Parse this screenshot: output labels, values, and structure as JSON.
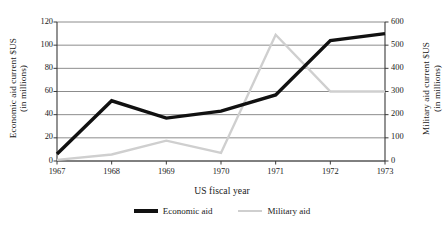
{
  "chart_data": {
    "type": "line",
    "title": "",
    "xlabel": "US fiscal year",
    "ylabel": "Economic aid current $US\n(in millions)",
    "y2label": "Military aid current $US\n(in millions)",
    "categories": [
      "1967",
      "1968",
      "1969",
      "1970",
      "1971",
      "1972",
      "1973"
    ],
    "ylim": [
      0,
      120
    ],
    "yticks": [
      "0",
      "20",
      "40",
      "60",
      "80",
      "100",
      "120"
    ],
    "y2lim": [
      0,
      600
    ],
    "y2ticks": [
      "0",
      "100",
      "200",
      "300",
      "400",
      "500",
      "600"
    ],
    "grid": true,
    "legend_position": "bottom",
    "series": [
      {
        "name": "Economic aid",
        "axis": "left",
        "color": "#111111",
        "width": 3.4,
        "values": [
          6,
          52,
          37,
          43,
          57,
          104,
          110
        ]
      },
      {
        "name": "Military aid",
        "axis": "right",
        "color": "#cfcfcf",
        "width": 2.4,
        "values": [
          5,
          28,
          88,
          35,
          545,
          300,
          300
        ]
      }
    ]
  },
  "axes": {
    "left_title_line1": "Economic aid current $US",
    "left_title_line2": "(in millions)",
    "right_title_line1": "Military aid current $US",
    "right_title_line2": "(in millions)",
    "x_title": "US fiscal year"
  },
  "legend": {
    "items": [
      {
        "label": "Economic aid",
        "swatch": "econ"
      },
      {
        "label": "Military aid",
        "swatch": "mil"
      }
    ]
  }
}
